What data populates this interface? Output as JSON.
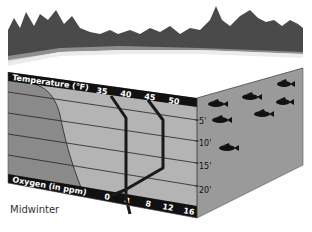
{
  "caption": "Midwinter",
  "diagram": {
    "type": "lake cross-section",
    "season": "Midwinter",
    "temperature_axis": {
      "label": "Temperature (°F)",
      "ticks": [
        "35",
        "40",
        "45",
        "50"
      ]
    },
    "oxygen_axis": {
      "label": "Oxygen (in ppm)",
      "ticks": [
        "0",
        "4",
        "8",
        "12",
        "16"
      ]
    },
    "depth_axis": {
      "ticks": [
        "5'",
        "10'",
        "15'",
        "20'"
      ]
    },
    "lines": [
      {
        "name": "temperature-profile",
        "description": "Near 35–39°F at surface, ~39°F through depth"
      },
      {
        "name": "oxygen-profile",
        "description": "High (~11 ppm) near surface, dropping to near 0 at bottom"
      }
    ],
    "fish_count": 8,
    "colors": {
      "ice_surface": "#ffffff",
      "water_front": "#b4b4b4",
      "oxygen_fill": "#8a8a8a",
      "water_side": "#9a9a9a",
      "band": "#111111",
      "profile_line": "#1a1a1a"
    }
  }
}
